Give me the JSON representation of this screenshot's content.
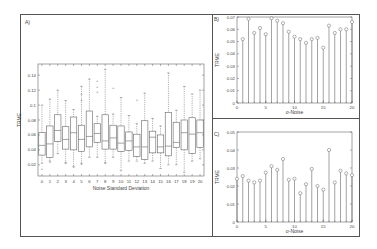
{
  "panels": {
    "a": {
      "label": "A)"
    },
    "b": {
      "label": "B)"
    },
    "c": {
      "label": "C)"
    }
  },
  "chart_data": [
    {
      "panel": "A",
      "type": "box",
      "title": "",
      "xlabel": "Noise Standard Deviation",
      "ylabel": "TRME",
      "ylim": [
        0.005,
        0.155
      ],
      "yticks": [
        0.02,
        0.04,
        0.06,
        0.08,
        0.1,
        0.12,
        0.14
      ],
      "ytick_labels": [
        "0.02",
        "0.04",
        "0.06",
        "0.08",
        "0.1",
        "0.12",
        "0.14"
      ],
      "categories": [
        "0",
        "1",
        "2",
        "3",
        "4",
        "5",
        "6",
        "7",
        "8",
        "9",
        "10",
        "11",
        "12",
        "13",
        "14",
        "15",
        "16",
        "17",
        "18",
        "19",
        "20"
      ],
      "boxes": [
        {
          "whisker_low": 0.022,
          "q1": 0.033,
          "median": 0.046,
          "q3": 0.063,
          "whisker_high": 0.1,
          "outliers": [
            0.015
          ]
        },
        {
          "whisker_low": 0.025,
          "q1": 0.03,
          "median": 0.048,
          "q3": 0.072,
          "whisker_high": 0.108,
          "outliers": [
            0.025
          ]
        },
        {
          "whisker_low": 0.035,
          "q1": 0.051,
          "median": 0.066,
          "q3": 0.087,
          "whisker_high": 0.12,
          "outliers": []
        },
        {
          "whisker_low": 0.022,
          "q1": 0.041,
          "median": 0.054,
          "q3": 0.071,
          "whisker_high": 0.106,
          "outliers": [
            0.025
          ]
        },
        {
          "whisker_low": 0.018,
          "q1": 0.04,
          "median": 0.063,
          "q3": 0.084,
          "whisker_high": 0.094,
          "outliers": [
            0.018
          ]
        },
        {
          "whisker_low": 0.022,
          "q1": 0.038,
          "median": 0.054,
          "q3": 0.073,
          "whisker_high": 0.125,
          "outliers": [
            0.022,
            0.115,
            0.107
          ]
        },
        {
          "whisker_low": 0.03,
          "q1": 0.044,
          "median": 0.058,
          "q3": 0.092,
          "whisker_high": 0.135,
          "outliers": []
        },
        {
          "whisker_low": 0.03,
          "q1": 0.05,
          "median": 0.062,
          "q3": 0.075,
          "whisker_high": 0.085,
          "outliers": [
            0.125,
            0.118,
            0.133
          ]
        },
        {
          "whisker_low": 0.022,
          "q1": 0.041,
          "median": 0.052,
          "q3": 0.087,
          "whisker_high": 0.148,
          "outliers": [
            0.025
          ]
        },
        {
          "whisker_low": 0.03,
          "q1": 0.041,
          "median": 0.056,
          "q3": 0.073,
          "whisker_high": 0.088,
          "outliers": [
            0.124
          ]
        },
        {
          "whisker_low": 0.012,
          "q1": 0.038,
          "median": 0.049,
          "q3": 0.072,
          "whisker_high": 0.11,
          "outliers": []
        },
        {
          "whisker_low": 0.025,
          "q1": 0.039,
          "median": 0.052,
          "q3": 0.064,
          "whisker_high": 0.086,
          "outliers": []
        },
        {
          "whisker_low": 0.025,
          "q1": 0.031,
          "median": 0.044,
          "q3": 0.061,
          "whisker_high": 0.075,
          "outliers": [
            0.108
          ]
        },
        {
          "whisker_low": 0.022,
          "q1": 0.027,
          "median": 0.044,
          "q3": 0.079,
          "whisker_high": 0.116,
          "outliers": []
        },
        {
          "whisker_low": 0.025,
          "q1": 0.036,
          "median": 0.057,
          "q3": 0.065,
          "whisker_high": 0.082,
          "outliers": []
        },
        {
          "whisker_low": 0.015,
          "q1": 0.036,
          "median": 0.044,
          "q3": 0.06,
          "whisker_high": 0.072,
          "outliers": []
        },
        {
          "whisker_low": 0.02,
          "q1": 0.032,
          "median": 0.045,
          "q3": 0.09,
          "whisker_high": 0.143,
          "outliers": []
        },
        {
          "whisker_low": 0.02,
          "q1": 0.043,
          "median": 0.05,
          "q3": 0.077,
          "whisker_high": 0.093,
          "outliers": []
        },
        {
          "whisker_low": 0.01,
          "q1": 0.04,
          "median": 0.063,
          "q3": 0.08,
          "whisker_high": 0.125,
          "outliers": []
        },
        {
          "whisker_low": 0.025,
          "q1": 0.035,
          "median": 0.061,
          "q3": 0.083,
          "whisker_high": 0.115,
          "outliers": []
        },
        {
          "whisker_low": 0.028,
          "q1": 0.043,
          "median": 0.063,
          "q3": 0.08,
          "whisker_high": 0.12,
          "outliers": []
        }
      ]
    },
    {
      "panel": "B",
      "type": "stem",
      "xlabel": "σ-Noise",
      "ylabel": "TRME",
      "xlim": [
        0,
        20
      ],
      "ylim": [
        0,
        0.07
      ],
      "xticks": [
        0,
        5,
        10,
        15,
        20
      ],
      "yticks": [
        0,
        0.01,
        0.02,
        0.03,
        0.04,
        0.05,
        0.06,
        0.07
      ],
      "ytick_labels": [
        "0",
        "0.01",
        "0.02",
        "0.03",
        "0.04",
        "0.05",
        "0.06",
        "0.07"
      ],
      "x": [
        1,
        2,
        3,
        4,
        5,
        6,
        7,
        8,
        9,
        10,
        11,
        12,
        13,
        14,
        15,
        16,
        17,
        18,
        19,
        20
      ],
      "values": [
        0.052,
        0.0685,
        0.057,
        0.061,
        0.056,
        0.069,
        0.067,
        0.065,
        0.058,
        0.054,
        0.052,
        0.049,
        0.052,
        0.053,
        0.045,
        0.063,
        0.057,
        0.06,
        0.06,
        0.066
      ]
    },
    {
      "panel": "C",
      "type": "stem",
      "xlabel": "σ-Noise",
      "ylabel": "TRME",
      "xlim": [
        0,
        20
      ],
      "ylim": [
        0,
        0.05
      ],
      "xticks": [
        0,
        5,
        10,
        15,
        20
      ],
      "yticks": [
        0,
        0.01,
        0.02,
        0.03,
        0.04,
        0.05
      ],
      "ytick_labels": [
        "0",
        "0.01",
        "0.02",
        "0.03",
        "0.04",
        "0.05"
      ],
      "x": [
        0,
        1,
        2,
        3,
        4,
        5,
        6,
        7,
        8,
        9,
        10,
        11,
        12,
        13,
        14,
        15,
        16,
        17,
        18,
        19,
        20
      ],
      "values": [
        0.024,
        0.0255,
        0.023,
        0.022,
        0.023,
        0.0275,
        0.031,
        0.029,
        0.035,
        0.0235,
        0.024,
        0.016,
        0.021,
        0.0295,
        0.02,
        0.018,
        0.04,
        0.022,
        0.0285,
        0.027,
        0.026
      ]
    }
  ]
}
